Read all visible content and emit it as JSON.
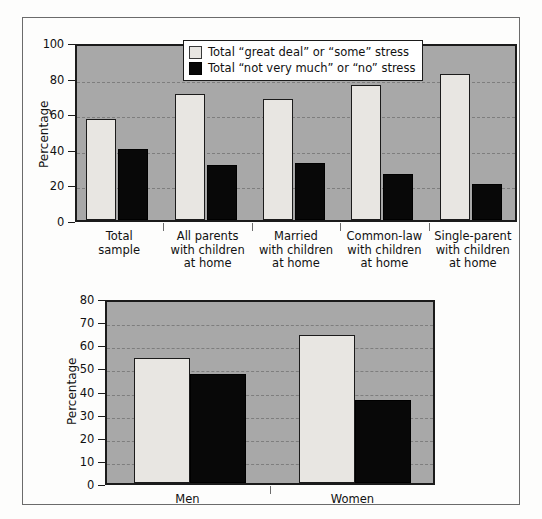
{
  "figure": {
    "background_color": "#fdfdfc",
    "frame_color": "#6b6b6b",
    "plot_background_color": "#a8a8a8",
    "light_series_color": "#e8e6e2",
    "dark_series_color": "#080808"
  },
  "legend": {
    "position": "top-center-inside",
    "entries": [
      {
        "swatch": "light",
        "label": "Total “great deal” or “some” stress"
      },
      {
        "swatch": "dark",
        "label": "Total “not very much” or “no” stress"
      }
    ]
  },
  "chart_data": [
    {
      "id": "chart-family-status",
      "type": "bar",
      "title": "",
      "xlabel": "",
      "ylabel": "Percentage",
      "ylim": [
        0,
        100
      ],
      "yticks": [
        0,
        20,
        40,
        60,
        80,
        100
      ],
      "ytick_labels": [
        "0",
        "20",
        "40",
        "60",
        "80",
        "100"
      ],
      "grid": true,
      "legend_position": "top-center",
      "categories": [
        "Total\nsample",
        "All parents\nwith children\nat home",
        "Married\nwith children\nat home",
        "Common-law\nwith children\nat home",
        "Single-parent\nwith children\nat home"
      ],
      "series": [
        {
          "name": "Total “great deal” or “some” stress",
          "key": "light",
          "values": [
            57,
            71,
            68,
            76,
            82
          ]
        },
        {
          "name": "Total “not very much” or “no” stress",
          "key": "dark",
          "values": [
            40,
            31,
            32,
            26,
            20
          ]
        }
      ]
    },
    {
      "id": "chart-gender",
      "type": "bar",
      "title": "",
      "xlabel": "",
      "ylabel": "Percentage",
      "ylim": [
        0,
        80
      ],
      "yticks": [
        0,
        10,
        20,
        30,
        40,
        50,
        60,
        70,
        80
      ],
      "ytick_labels": [
        "0",
        "10",
        "20",
        "30",
        "40",
        "50",
        "60",
        "70",
        "80"
      ],
      "grid": true,
      "legend_position": "none",
      "categories": [
        "Men",
        "Women"
      ],
      "series": [
        {
          "name": "Total “great deal” or “some” stress",
          "key": "light",
          "values": [
            54,
            64
          ]
        },
        {
          "name": "Total “not very much” or “no” stress",
          "key": "dark",
          "values": [
            47,
            36
          ]
        }
      ]
    }
  ]
}
